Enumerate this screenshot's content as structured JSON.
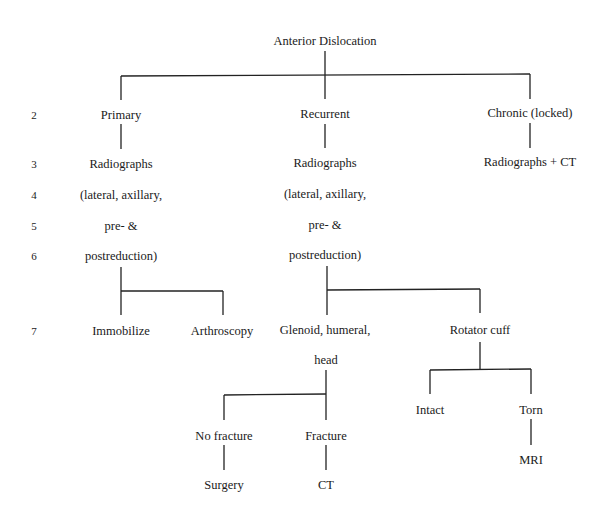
{
  "diagram": {
    "root": "Anterior Dislocation",
    "row_numbers": [
      "2",
      "3",
      "4",
      "5",
      "6",
      "7"
    ],
    "primary": {
      "label": "Primary",
      "imaging": [
        "Radiographs",
        "(lateral, axillary,",
        "pre- &",
        "postreduction)"
      ],
      "children": [
        "Immobilize",
        "Arthroscopy"
      ]
    },
    "recurrent": {
      "label": "Recurrent",
      "imaging": [
        "Radiographs",
        "(lateral, axillary,",
        "pre- &",
        "postreduction)"
      ],
      "glenoid": {
        "label_line1": "Glenoid, humeral,",
        "label_line2": "head",
        "children": [
          {
            "label": "No fracture",
            "next": "Surgery"
          },
          {
            "label": "Fracture",
            "next": "CT"
          }
        ]
      },
      "rotator": {
        "label": "Rotator cuff",
        "children": [
          {
            "label": "Intact"
          },
          {
            "label": "Torn",
            "next": "MRI"
          }
        ]
      }
    },
    "chronic": {
      "label": "Chronic (locked)",
      "imaging": "Radiographs + CT"
    }
  }
}
